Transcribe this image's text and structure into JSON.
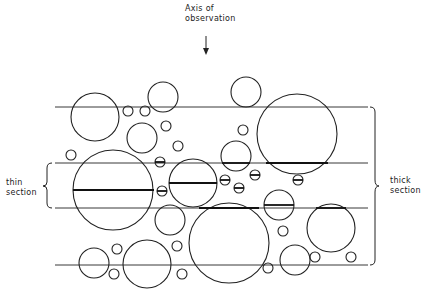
{
  "labels": {
    "axis_line1": "Axis of",
    "axis_line2": "observation",
    "thin_line1": "thin",
    "thin_line2": "section",
    "thick_line1": "thick",
    "thick_line2": "section"
  },
  "colors": {
    "stroke": "#222222",
    "background": "#ffffff"
  },
  "planes_y": [
    107,
    163,
    208,
    265
  ],
  "planes_x": [
    55,
    368
  ],
  "thin_section": {
    "top_y": 163,
    "bottom_y": 208
  },
  "thick_section": {
    "top_y": 107,
    "bottom_y": 265
  },
  "circles": [
    {
      "cx": 95,
      "cy": 117,
      "r": 24
    },
    {
      "cx": 163,
      "cy": 97,
      "r": 15
    },
    {
      "cx": 128,
      "cy": 111,
      "r": 5
    },
    {
      "cx": 145,
      "cy": 111,
      "r": 5
    },
    {
      "cx": 142,
      "cy": 138,
      "r": 15
    },
    {
      "cx": 166,
      "cy": 126,
      "r": 5
    },
    {
      "cx": 71,
      "cy": 155,
      "r": 5
    },
    {
      "cx": 178,
      "cy": 146,
      "r": 5
    },
    {
      "cx": 246,
      "cy": 92,
      "r": 15
    },
    {
      "cx": 243,
      "cy": 130,
      "r": 5
    },
    {
      "cx": 297,
      "cy": 134,
      "r": 40
    },
    {
      "cx": 236,
      "cy": 156,
      "r": 15
    },
    {
      "cx": 113,
      "cy": 190,
      "r": 40
    },
    {
      "cx": 193,
      "cy": 183,
      "r": 24
    },
    {
      "cx": 160,
      "cy": 162,
      "r": 5
    },
    {
      "cx": 162,
      "cy": 191,
      "r": 5
    },
    {
      "cx": 225,
      "cy": 180,
      "r": 5
    },
    {
      "cx": 239,
      "cy": 188,
      "r": 5
    },
    {
      "cx": 255,
      "cy": 175,
      "r": 5
    },
    {
      "cx": 298,
      "cy": 180,
      "r": 5
    },
    {
      "cx": 279,
      "cy": 205,
      "r": 15
    },
    {
      "cx": 170,
      "cy": 220,
      "r": 15
    },
    {
      "cx": 229,
      "cy": 243,
      "r": 40
    },
    {
      "cx": 283,
      "cy": 231,
      "r": 5
    },
    {
      "cx": 331,
      "cy": 228,
      "r": 24
    },
    {
      "cx": 94,
      "cy": 263,
      "r": 15
    },
    {
      "cx": 117,
      "cy": 249,
      "r": 5
    },
    {
      "cx": 147,
      "cy": 264,
      "r": 24
    },
    {
      "cx": 114,
      "cy": 274,
      "r": 5
    },
    {
      "cx": 177,
      "cy": 246,
      "r": 5
    },
    {
      "cx": 182,
      "cy": 274,
      "r": 5
    },
    {
      "cx": 268,
      "cy": 268,
      "r": 5
    },
    {
      "cx": 295,
      "cy": 260,
      "r": 15
    },
    {
      "cx": 315,
      "cy": 257,
      "r": 5
    },
    {
      "cx": 351,
      "cy": 257,
      "r": 5
    }
  ],
  "section_chords": [
    {
      "x1": 73,
      "x2": 154,
      "y": 190
    },
    {
      "x1": 169,
      "x2": 217,
      "y": 183
    },
    {
      "x1": 155,
      "x2": 165,
      "y": 162
    },
    {
      "x1": 157,
      "x2": 167,
      "y": 191
    },
    {
      "x1": 220,
      "x2": 230,
      "y": 180
    },
    {
      "x1": 234,
      "x2": 244,
      "y": 188
    },
    {
      "x1": 250,
      "x2": 260,
      "y": 175
    },
    {
      "x1": 293,
      "x2": 303,
      "y": 180
    },
    {
      "x1": 264,
      "x2": 294,
      "y": 205
    },
    {
      "x1": 222,
      "x2": 250,
      "y": 163
    },
    {
      "x1": 266,
      "x2": 328,
      "y": 163
    },
    {
      "x1": 199,
      "x2": 259,
      "y": 208
    },
    {
      "x1": 316,
      "x2": 346,
      "y": 208
    }
  ]
}
